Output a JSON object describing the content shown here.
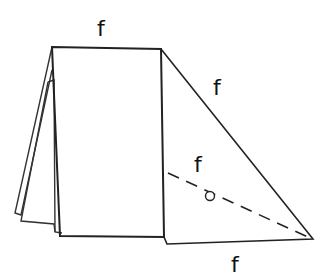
{
  "diagram": {
    "type": "folded-paper-sketch",
    "labels": {
      "top_edge": "f",
      "diagonal_edge": "f",
      "dashed_fold": "f",
      "bottom_edge": "f"
    },
    "colors": {
      "stroke": "#222222",
      "background": "#ffffff"
    },
    "marker": "circle-point"
  }
}
